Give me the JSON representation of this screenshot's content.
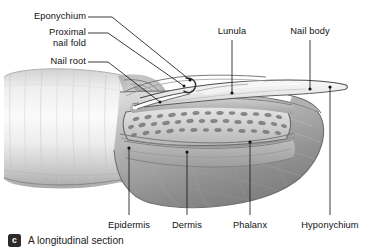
{
  "figure": {
    "kind": "anatomical-illustration",
    "palette": {
      "background": "#ffffff",
      "ink": "#111111",
      "skin_light": "#f2f2f2",
      "skin_mid": "#c9c9c9",
      "skin_dark": "#8e8e8e",
      "shadow": "#6d6d6d",
      "nail_plate": "#e8e8e8",
      "bone_fill": "#d8d8d8",
      "bone_speckle": "#6f6f6f",
      "bed_fill": "#bdbdbd",
      "outline": "#3a3a3a"
    }
  },
  "labels": {
    "left": [
      {
        "id": "eponychium",
        "text": "Eponychium"
      },
      {
        "id": "proximal",
        "text": "Proximal"
      },
      {
        "id": "nail_fold",
        "text": "nail fold"
      },
      {
        "id": "nail_root",
        "text": "Nail root"
      }
    ],
    "top": [
      {
        "id": "lunula",
        "text": "Lunula"
      },
      {
        "id": "nail_body",
        "text": "Nail body"
      }
    ],
    "bottom": [
      {
        "id": "epidermis",
        "text": "Epidermis"
      },
      {
        "id": "dermis",
        "text": "Dermis"
      },
      {
        "id": "phalanx",
        "text": "Phalanx"
      },
      {
        "id": "hyponychium",
        "text": "Hyponychium"
      }
    ]
  },
  "caption": {
    "badge": "c",
    "text": "A longitudinal section"
  }
}
